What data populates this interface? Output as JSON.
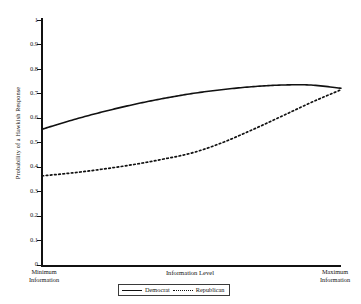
{
  "chart_data": {
    "type": "line",
    "title": "",
    "xlabel": "Information Level",
    "ylabel": "Probability of a Hawkish Response",
    "xlim": [
      0,
      1
    ],
    "ylim": [
      0,
      1
    ],
    "grid": false,
    "legend_position": "bottom",
    "x_tick_labels": [
      "Minimum Information",
      "Maximum Information"
    ],
    "x_tick_label_left_line1": "Minimum",
    "x_tick_label_left_line2": "Information",
    "x_tick_label_right_line1": "Maximum",
    "x_tick_label_right_line2": "Information",
    "y_ticks": [
      1,
      0.9,
      0.8,
      0.7,
      0.6,
      0.5,
      0.4,
      0.3,
      0.2,
      0.1,
      0
    ],
    "y_tick_labels": [
      "1",
      "0.9",
      "0.8",
      "0.7",
      "0.6",
      "0.5",
      "0.4",
      "0.3",
      "0.2",
      "0.1",
      "0"
    ],
    "x": [
      0,
      0.1,
      0.2,
      0.3,
      0.4,
      0.5,
      0.6,
      0.7,
      0.8,
      0.9,
      1.0
    ],
    "series": [
      {
        "name": "Democrat",
        "style": "solid",
        "color": "#111111",
        "values": [
          0.555,
          0.592,
          0.625,
          0.654,
          0.679,
          0.7,
          0.716,
          0.728,
          0.735,
          0.735,
          0.722
        ]
      },
      {
        "name": "Republican",
        "style": "dashed",
        "color": "#111111",
        "values": [
          0.365,
          0.377,
          0.392,
          0.41,
          0.432,
          0.458,
          0.499,
          0.551,
          0.607,
          0.664,
          0.716
        ]
      }
    ]
  },
  "legend": {
    "democrat_label": "Democrat",
    "republican_label": "Republican"
  }
}
